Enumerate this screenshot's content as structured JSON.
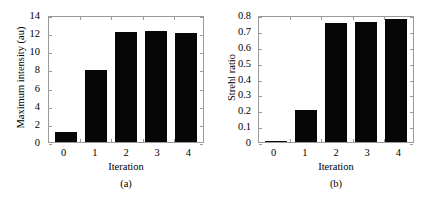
{
  "figure": {
    "background": "#ffffff",
    "bar_color": "#060606",
    "axis_color": "#9a9a9a"
  },
  "chart_data": [
    {
      "type": "bar",
      "panel": "a",
      "caption": "(a)",
      "title": "",
      "xlabel": "Iteration",
      "ylabel": "Maximum intensity (au)",
      "categories": [
        "0",
        "1",
        "2",
        "3",
        "4"
      ],
      "values": [
        1.05,
        7.95,
        12.15,
        12.25,
        12.05
      ],
      "ylim": [
        0,
        14
      ],
      "yticks": [
        "0",
        "2",
        "4",
        "6",
        "8",
        "10",
        "12",
        "14"
      ],
      "ytick_values": [
        0,
        2,
        4,
        6,
        8,
        10,
        12,
        14
      ],
      "xticks": [
        "0",
        "1",
        "2",
        "3",
        "4"
      ],
      "grid": false,
      "legend": "none"
    },
    {
      "type": "bar",
      "panel": "b",
      "caption": "(b)",
      "title": "",
      "xlabel": "Iteration",
      "ylabel": "Strehl ratio",
      "categories": [
        "0",
        "1",
        "2",
        "3",
        "4"
      ],
      "values": [
        0.005,
        0.2,
        0.75,
        0.757,
        0.778
      ],
      "ylim": [
        0,
        0.8
      ],
      "yticks": [
        "0",
        "0.1",
        "0.2",
        "0.3",
        "0.4",
        "0.5",
        "0.6",
        "0.7",
        "0.8"
      ],
      "ytick_values": [
        0,
        0.1,
        0.2,
        0.3,
        0.4,
        0.5,
        0.6,
        0.7,
        0.8
      ],
      "xticks": [
        "0",
        "1",
        "2",
        "3",
        "4"
      ],
      "grid": false,
      "legend": "none"
    }
  ]
}
